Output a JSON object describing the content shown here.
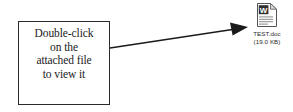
{
  "canvas": {
    "width": 293,
    "height": 112,
    "background_color": "#ffffff"
  },
  "callout": {
    "name": "instruction-callout",
    "border_color": "#2b2b2b",
    "background_color": "#ffffff",
    "text_color": "#1b1b1b",
    "lines": [
      "Double-click",
      "on the",
      "attached file",
      "to view it"
    ],
    "line1": "Double-click",
    "line2": "on the",
    "line3": "attached file",
    "line4": "to view it"
  },
  "arrow": {
    "name": "pointer-arrow",
    "color": "#1a1a1a",
    "from": {
      "x": 110,
      "y": 48
    },
    "to": {
      "x": 248,
      "y": 27
    },
    "head": "solid-triangle"
  },
  "attachment": {
    "icon_name": "word-document-icon",
    "icon_emblem": "W",
    "page_color": "#ffffff",
    "page_border_color": "#555555",
    "emblem_color": "#2f2f2f",
    "filename": "TEST.doc",
    "filesize": "(19.0 KB)",
    "label_color": "#2a2a2a"
  }
}
